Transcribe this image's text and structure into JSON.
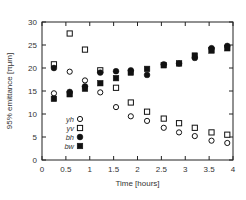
{
  "chart_data": {
    "type": "scatter",
    "title": "",
    "xlabel": "Time [hours]",
    "ylabel": "95% emittance [πμm]",
    "xlim": [
      0,
      4
    ],
    "ylim": [
      0,
      30
    ],
    "xticks": [
      "0",
      "0.5",
      "1",
      "1.5",
      "2",
      "2.5",
      "3",
      "3.5",
      "4"
    ],
    "yticks": [
      "0",
      "5",
      "10",
      "15",
      "20",
      "25",
      "30"
    ],
    "grid": false,
    "legend_placement": "lower-left",
    "series": [
      {
        "name": "yh",
        "marker": "open-circle",
        "x": [
          0.25,
          0.58,
          0.9,
          1.22,
          1.55,
          1.86,
          2.2,
          2.55,
          2.87,
          3.2,
          3.55,
          3.88
        ],
        "y": [
          14.5,
          19.2,
          17.3,
          14.7,
          11.5,
          9.5,
          8.5,
          7.0,
          6.0,
          5.2,
          4.2,
          3.7
        ]
      },
      {
        "name": "yv",
        "marker": "open-square",
        "x": [
          0.25,
          0.58,
          0.9,
          1.22,
          1.55,
          1.86,
          2.2,
          2.55,
          2.87,
          3.2,
          3.55,
          3.88
        ],
        "y": [
          20.8,
          27.5,
          24.0,
          19.5,
          15.7,
          12.5,
          10.5,
          9.0,
          8.0,
          7.0,
          6.0,
          5.5
        ]
      },
      {
        "name": "bh",
        "marker": "filled-circle",
        "x": [
          0.25,
          0.58,
          0.9,
          1.22,
          1.55,
          1.86,
          2.2,
          2.55,
          2.87,
          3.2,
          3.55,
          3.88
        ],
        "y": [
          20.0,
          14.8,
          16.0,
          19.0,
          19.3,
          19.5,
          18.5,
          20.8,
          21.0,
          22.2,
          24.3,
          24.8
        ]
      },
      {
        "name": "bw",
        "marker": "filled-square",
        "x": [
          0.25,
          0.58,
          0.9,
          1.22,
          1.55,
          1.86,
          2.2,
          2.55,
          2.87,
          3.2,
          3.55,
          3.88
        ],
        "y": [
          13.3,
          14.3,
          15.5,
          16.7,
          17.8,
          19.0,
          19.8,
          20.6,
          21.0,
          22.7,
          23.8,
          24.3
        ]
      }
    ]
  }
}
